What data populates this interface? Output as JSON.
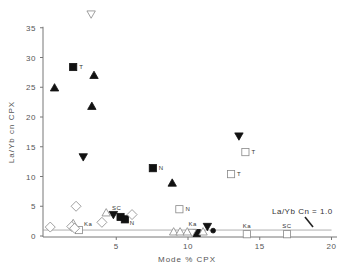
{
  "chart_data": {
    "type": "scatter",
    "title": "",
    "xlabel": "Mode % CPX",
    "ylabel": "La/Yb cn CPX",
    "xlim": [
      0,
      20.5
    ],
    "ylim": [
      0,
      37
    ],
    "x_ticks": [
      5,
      10,
      15,
      20
    ],
    "y_ticks": [
      0,
      5,
      10,
      15,
      20,
      25,
      30,
      35
    ],
    "grid": false,
    "legend": null,
    "reference_line": {
      "y": 1.0,
      "label": "La/Yb Cn = 1.0",
      "x_from": 0,
      "x_to": 20
    },
    "series": [
      {
        "name": "filled-triangle-up",
        "marker": "triangle-up",
        "filled": true,
        "points": [
          {
            "x": 0.7,
            "y": 24.9,
            "label": ""
          },
          {
            "x": 3.45,
            "y": 27.0,
            "label": ""
          },
          {
            "x": 3.3,
            "y": 21.8,
            "label": ""
          },
          {
            "x": 8.9,
            "y": 8.9,
            "label": ""
          }
        ]
      },
      {
        "name": "filled-triangle-down",
        "marker": "triangle-down",
        "filled": true,
        "points": [
          {
            "x": 2.7,
            "y": 13.3,
            "label": ""
          },
          {
            "x": 13.55,
            "y": 16.8,
            "label": ""
          },
          {
            "x": 4.8,
            "y": 3.6,
            "label": ""
          },
          {
            "x": 11.35,
            "y": 1.6,
            "label": ""
          }
        ]
      },
      {
        "name": "filled-square",
        "marker": "square",
        "filled": true,
        "points": [
          {
            "x": 2.0,
            "y": 28.4,
            "label": "T"
          },
          {
            "x": 7.55,
            "y": 11.4,
            "label": "N"
          },
          {
            "x": 5.3,
            "y": 3.2,
            "label": "SC"
          },
          {
            "x": 5.6,
            "y": 2.8,
            "label": "N"
          },
          {
            "x": 10.6,
            "y": 0.5,
            "label": "Ka"
          }
        ]
      },
      {
        "name": "filled-circle",
        "marker": "circle",
        "filled": true,
        "points": [
          {
            "x": 11.75,
            "y": 0.9,
            "label": ""
          }
        ]
      },
      {
        "name": "open-square",
        "marker": "square",
        "filled": false,
        "points": [
          {
            "x": 14.0,
            "y": 14.1,
            "label": "T"
          },
          {
            "x": 13.0,
            "y": 10.4,
            "label": "T"
          },
          {
            "x": 9.4,
            "y": 4.5,
            "label": "N"
          },
          {
            "x": 2.4,
            "y": 1.0,
            "label": "Ka"
          },
          {
            "x": 14.1,
            "y": 0.3,
            "label": "Ka"
          },
          {
            "x": 16.9,
            "y": 0.3,
            "label": "SC"
          }
        ]
      },
      {
        "name": "open-triangle-up",
        "marker": "triangle-up",
        "filled": false,
        "points": [
          {
            "x": 2.0,
            "y": 2.1,
            "label": ""
          },
          {
            "x": 4.3,
            "y": 3.9,
            "label": ""
          },
          {
            "x": 9.0,
            "y": 0.7,
            "label": ""
          },
          {
            "x": 9.45,
            "y": 0.7,
            "label": ""
          },
          {
            "x": 9.95,
            "y": 0.7,
            "label": ""
          },
          {
            "x": 11.05,
            "y": 0.7,
            "label": ""
          }
        ]
      },
      {
        "name": "open-triangle-down",
        "marker": "triangle-down",
        "filled": false,
        "points": [
          {
            "x": 3.25,
            "y": 37.3,
            "label": ""
          },
          {
            "x": 10.3,
            "y": 0.6,
            "label": ""
          }
        ]
      },
      {
        "name": "open-diamond",
        "marker": "diamond",
        "filled": false,
        "points": [
          {
            "x": 0.4,
            "y": 1.5,
            "label": ""
          },
          {
            "x": 1.9,
            "y": 1.6,
            "label": ""
          },
          {
            "x": 2.1,
            "y": 1.3,
            "label": ""
          },
          {
            "x": 2.2,
            "y": 5.0,
            "label": ""
          },
          {
            "x": 4.0,
            "y": 2.3,
            "label": ""
          },
          {
            "x": 6.1,
            "y": 3.6,
            "label": ""
          }
        ]
      }
    ]
  },
  "axes": {
    "x_tick_labels": [
      "5",
      "10",
      "15",
      "20"
    ],
    "y_tick_labels": [
      "0",
      "5",
      "10",
      "15",
      "20",
      "25",
      "30",
      "35"
    ],
    "x_title": "Mode % CPX",
    "y_title": "La/Yb cn CPX"
  },
  "annotation": {
    "text": "La/Yb Cn = 1.0"
  },
  "colors": {
    "axis": "#777777",
    "marker": "#111111",
    "open_marker": "#888888",
    "text": "#444444"
  }
}
